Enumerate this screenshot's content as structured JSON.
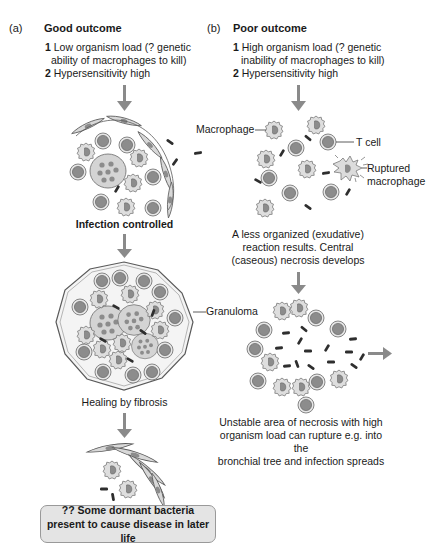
{
  "panels": {
    "a": {
      "letter": "(a)",
      "title": "Good outcome",
      "conditions": [
        {
          "num": "1",
          "text": "Low organism load (? genetic",
          "cont": "ability of macrophages to kill)"
        },
        {
          "num": "2",
          "text": "Hypersensitivity high"
        }
      ],
      "captions": {
        "stage1": "Infection controlled",
        "stage2": "Healing by fibrosis"
      },
      "labels": {
        "granuloma": "Granuloma"
      },
      "note": {
        "line1": "?? Some dormant bacteria",
        "line2": "present to cause disease in later life"
      }
    },
    "b": {
      "letter": "(b)",
      "title": "Poor outcome",
      "conditions": [
        {
          "num": "1",
          "text": "High organism load (? genetic",
          "cont": "inability of macrophages to kill)"
        },
        {
          "num": "2",
          "text": "Hypersensitivity high"
        }
      ],
      "labels": {
        "macrophage": "Macrophage",
        "tcell": "T cell",
        "ruptured1": "Ruptured",
        "ruptured2": "macrophage"
      },
      "captions": {
        "stage1_l1": "A less organized (exudative)",
        "stage1_l2": "reaction results. Central",
        "stage1_l3": "(caseous) necrosis develops",
        "stage2_l1": "Unstable area of necrosis with high",
        "stage2_l2": "organism load can rupture e.g. into the",
        "stage2_l3": "bronchial tree and infection spreads"
      }
    }
  },
  "colors": {
    "arrow": "#8a8a8a",
    "cell_fill": "#d9d9d9",
    "nucleus": "#8c8c8c",
    "bacteria": "#2e2e2e",
    "note_bg": "#e4e4e4"
  }
}
